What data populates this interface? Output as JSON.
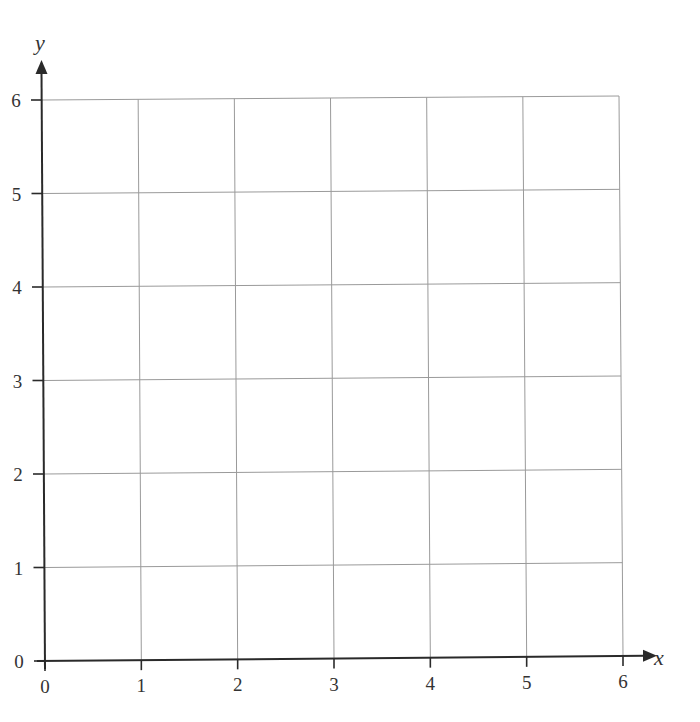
{
  "chart_data": {
    "type": "scatter",
    "title": "",
    "xlabel": "x",
    "ylabel": "y",
    "xlim": [
      0,
      6
    ],
    "ylim": [
      0,
      6
    ],
    "x_ticks": [
      "0",
      "1",
      "2",
      "3",
      "4",
      "5",
      "6"
    ],
    "y_ticks": [
      "0",
      "1",
      "2",
      "3",
      "4",
      "5",
      "6"
    ],
    "grid": true,
    "series": []
  },
  "axes": {
    "x_label": "x",
    "y_label": "y"
  },
  "colors": {
    "axis": "#2a2a2a",
    "grid": "#9a9a9a",
    "text": "#333333"
  }
}
